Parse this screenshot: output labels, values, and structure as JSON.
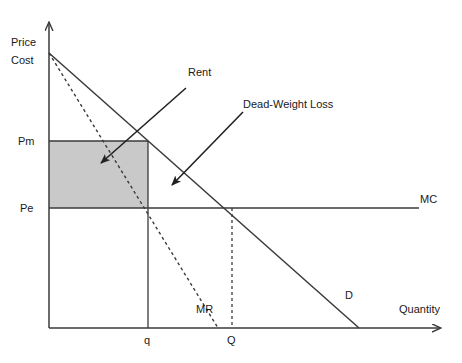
{
  "figure": {
    "type": "economics-diagram",
    "background_color": "#ffffff",
    "line_color": "#3a3a3a",
    "shade_color": "#c9c9c9",
    "text_color": "#1a1a1a"
  },
  "axes": {
    "y_label_line1": "Price",
    "y_label_line2": "Cost",
    "x_label": "Quantity",
    "origin": {
      "x": 49,
      "y": 328
    },
    "y_top": {
      "x": 49,
      "y": 19
    },
    "x_right": {
      "x": 445,
      "y": 328
    }
  },
  "price_ticks": [
    {
      "name": "Pm",
      "label": "Pm",
      "y": 141
    },
    {
      "name": "Pe",
      "label": "Pe",
      "y": 208
    }
  ],
  "quantity_ticks": [
    {
      "name": "q",
      "label": "q",
      "x": 148
    },
    {
      "name": "Q",
      "label": "Q",
      "x": 232
    }
  ],
  "curves": [
    {
      "name": "demand",
      "label": "D",
      "style": "solid",
      "from": {
        "x": 49,
        "y": 53
      },
      "to": {
        "x": 359,
        "y": 328
      }
    },
    {
      "name": "marginal-revenue",
      "label": "MR",
      "style": "dashed",
      "from": {
        "x": 49,
        "y": 53
      },
      "to": {
        "x": 218,
        "y": 328
      }
    },
    {
      "name": "marginal-cost",
      "label": "MC",
      "style": "solid",
      "from": {
        "x": 49,
        "y": 208
      },
      "to": {
        "x": 419,
        "y": 208
      }
    }
  ],
  "regions": [
    {
      "name": "rent-rectangle",
      "label": "Rent",
      "fill": "#c9c9c9",
      "x": 49,
      "y": 141,
      "width": 99,
      "height": 67
    }
  ],
  "annotations": [
    {
      "name": "rent",
      "label": "Rent",
      "arrow_from": {
        "x": 186,
        "y": 88
      },
      "arrow_to": {
        "x": 98,
        "y": 166
      }
    },
    {
      "name": "dead-weight-loss",
      "label": "Dead-Weight Loss",
      "arrow_from": {
        "x": 243,
        "y": 112
      },
      "arrow_to": {
        "x": 169,
        "y": 188
      }
    }
  ],
  "guide_lines": [
    {
      "name": "q-vertical",
      "style": "solid",
      "x": 148,
      "y1": 141,
      "y2": 328
    },
    {
      "name": "Q-vertical",
      "style": "dashed",
      "x": 232,
      "y1": 208,
      "y2": 328
    }
  ]
}
